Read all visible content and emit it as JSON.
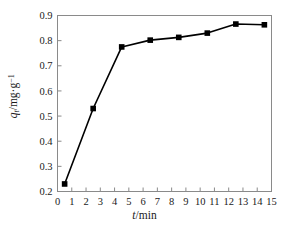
{
  "chart_data": {
    "type": "line",
    "title": "",
    "subtitle": "",
    "xlabel": "t/min",
    "ylabel": "qt/mg·g-1",
    "xlabel_parts": {
      "var": "t",
      "unit": "/min"
    },
    "ylabel_parts": {
      "var": "q",
      "var_sub": "t",
      "unit": "/mg·g",
      "unit_sup": "-1"
    },
    "x": [
      0.5,
      2.5,
      4.5,
      6.5,
      8.5,
      10.5,
      12.5,
      14.5
    ],
    "values": [
      0.23,
      0.53,
      0.775,
      0.802,
      0.813,
      0.83,
      0.866,
      0.863
    ],
    "series": [
      {
        "name": "qt",
        "x": [
          0.5,
          2.5,
          4.5,
          6.5,
          8.5,
          10.5,
          12.5,
          14.5
        ],
        "values": [
          0.23,
          0.53,
          0.775,
          0.802,
          0.813,
          0.83,
          0.866,
          0.863
        ]
      }
    ],
    "xlim": [
      0,
      15
    ],
    "ylim": [
      0.2,
      0.9
    ],
    "xticks": [
      0,
      1,
      2,
      3,
      4,
      5,
      6,
      7,
      8,
      9,
      10,
      11,
      12,
      13,
      14,
      15
    ],
    "xticklabels": [
      "0",
      "1",
      "2",
      "3",
      "4",
      "5",
      "6",
      "7",
      "8",
      "9",
      "10",
      "11",
      "12",
      "13",
      "14",
      "15"
    ],
    "yticks": [
      0.2,
      0.3,
      0.4,
      0.5,
      0.6,
      0.7,
      0.8,
      0.9
    ],
    "yticklabels": [
      "0.2",
      "0.3",
      "0.4",
      "0.5",
      "0.6",
      "0.7",
      "0.8",
      "0.9"
    ],
    "grid": false,
    "legend": false,
    "legend_position": "none",
    "marker": "square",
    "marker_color": "#000000",
    "line_color": "#000000",
    "frame": true,
    "background": "#ffffff"
  }
}
